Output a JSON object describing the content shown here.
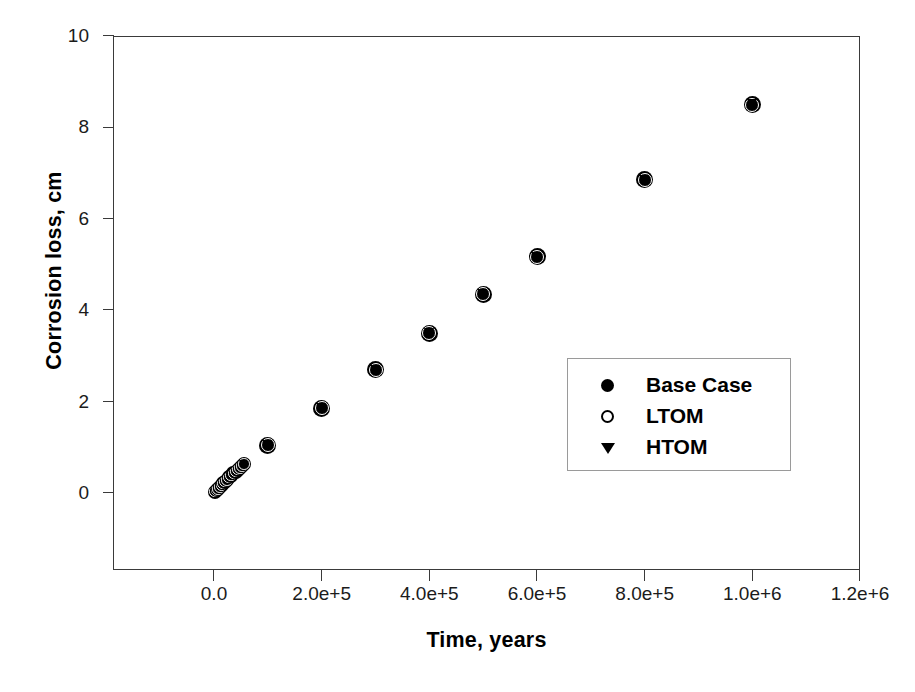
{
  "chart_data": {
    "type": "scatter",
    "title": "",
    "xlabel": "Time, years",
    "ylabel": "Corrosion loss, cm",
    "xlim": [
      -190000,
      1200000
    ],
    "ylim": [
      -1.67,
      10
    ],
    "grid": false,
    "legend_position": "center-right",
    "xticks": [
      {
        "value": 0,
        "label": "0.0"
      },
      {
        "value": 200000,
        "label": "2.0e+5"
      },
      {
        "value": 400000,
        "label": "4.0e+5"
      },
      {
        "value": 600000,
        "label": "6.0e+5"
      },
      {
        "value": 800000,
        "label": "8.0e+5"
      },
      {
        "value": 1000000,
        "label": "1.0e+6"
      },
      {
        "value": 1200000,
        "label": "1.2e+6"
      }
    ],
    "yticks": [
      {
        "value": 0,
        "label": "0"
      },
      {
        "value": 2,
        "label": "2"
      },
      {
        "value": 4,
        "label": "4"
      },
      {
        "value": 6,
        "label": "6"
      },
      {
        "value": 8,
        "label": "8"
      },
      {
        "value": 10,
        "label": "10"
      }
    ],
    "x": [
      2000,
      5000,
      8000,
      11000,
      14000,
      17000,
      20000,
      24000,
      28000,
      32000,
      36000,
      40000,
      44000,
      48000,
      52000,
      56000,
      100000,
      200000,
      300000,
      400000,
      500000,
      600000,
      800000,
      1000000
    ],
    "series": [
      {
        "name": "Base Case",
        "marker": "filled-circle",
        "color": "#000000",
        "values": [
          0.03,
          0.06,
          0.09,
          0.13,
          0.17,
          0.21,
          0.25,
          0.29,
          0.34,
          0.38,
          0.43,
          0.47,
          0.51,
          0.55,
          0.59,
          0.63,
          1.05,
          1.85,
          2.7,
          3.5,
          4.35,
          5.17,
          6.85,
          8.5
        ]
      },
      {
        "name": "LTOM",
        "marker": "open-circle",
        "color": "#000000",
        "values": [
          0.03,
          0.06,
          0.09,
          0.13,
          0.17,
          0.21,
          0.25,
          0.29,
          0.34,
          0.38,
          0.43,
          0.47,
          0.51,
          0.55,
          0.59,
          0.63,
          1.05,
          1.85,
          2.7,
          3.5,
          4.35,
          5.17,
          6.85,
          8.5
        ]
      },
      {
        "name": "HTOM",
        "marker": "filled-triangle-down",
        "color": "#000000",
        "values": [
          0.03,
          0.06,
          0.09,
          0.13,
          0.17,
          0.21,
          0.25,
          0.29,
          0.34,
          0.38,
          0.43,
          0.47,
          0.51,
          0.55,
          0.59,
          0.63,
          1.05,
          1.85,
          2.7,
          3.5,
          4.35,
          5.17,
          6.85,
          8.5
        ]
      }
    ]
  },
  "legend": {
    "items": [
      {
        "label": "Base Case",
        "symbol": "filled-circle"
      },
      {
        "label": "LTOM",
        "symbol": "open-circle"
      },
      {
        "label": "HTOM",
        "symbol": "filled-triangle-down"
      }
    ]
  }
}
